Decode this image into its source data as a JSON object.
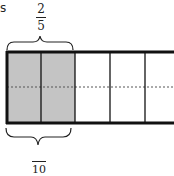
{
  "labels": {
    "corner_fragment": "s",
    "top_fraction_numerator": "2",
    "top_fraction_denominator": "5",
    "bottom_fraction_denominator": "10"
  },
  "diagram": {
    "total_columns": 5,
    "shaded_columns": 2,
    "rows_split_dashed": 2,
    "shade_color": "#c4c4c4",
    "line_color": "#111111"
  }
}
